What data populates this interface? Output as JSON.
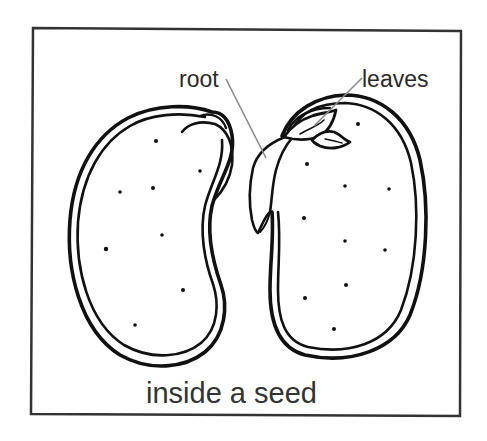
{
  "diagram": {
    "title": "inside a seed",
    "labels": {
      "root": "root",
      "leaves": "leaves"
    },
    "parts": [
      {
        "name": "left-cotyledon",
        "description": "left half of bean seed with seed coat"
      },
      {
        "name": "right-cotyledon",
        "description": "right half of bean seed with embryo attached"
      },
      {
        "name": "embryo-root",
        "label": "root"
      },
      {
        "name": "embryo-leaves",
        "label": "leaves"
      }
    ],
    "colors": {
      "outline": "#111111",
      "leader_line": "#8a8a8a",
      "frame": "#333333",
      "text": "#2a2a2a",
      "background": "#ffffff"
    }
  }
}
